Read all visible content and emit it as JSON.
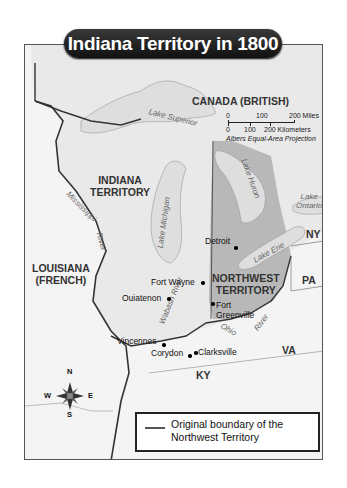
{
  "title": "Indiana Territory in 1800",
  "regions": {
    "canada": "CANADA (BRITISH)",
    "indiana": [
      "INDIANA",
      "TERRITORY"
    ],
    "louisiana": [
      "LOUISIANA",
      "(FRENCH)"
    ],
    "northwest": [
      "NORTHWEST",
      "TERRITORY"
    ],
    "ny": "NY",
    "pa": "PA",
    "va": "VA",
    "ky": "KY"
  },
  "water": {
    "superior": "Lake Superior",
    "michigan": "Lake Michigan",
    "huron": "Lake Huron",
    "erie": "Lake Erie",
    "ontario": [
      "Lake",
      "Ontario"
    ],
    "mississippi": "Mississippi",
    "mississippi_river": "River",
    "wabash": "Wabash River",
    "ohio": "Ohio",
    "ohio_river": "River"
  },
  "cities": {
    "detroit": "Detroit",
    "fort_wayne": "Fort Wayne",
    "ouiatenon": "Ouiatenon",
    "fort_greenville": [
      "Fort",
      "Greenville"
    ],
    "vincennes": "Vincennes",
    "corydon": "Corydon",
    "clarksville": "Clarksville"
  },
  "scale": {
    "miles": [
      "0",
      "100",
      "200 Miles"
    ],
    "km": [
      "0",
      "100",
      "200 Kilometers"
    ],
    "projection": "Albers Equal-Area Projection"
  },
  "compass": {
    "n": "N",
    "s": "S",
    "e": "E",
    "w": "W"
  },
  "legend": {
    "text": [
      "Original boundary of the",
      "Northwest Territory"
    ]
  },
  "colors": {
    "land": "#ececec",
    "water": "#dcdcdc",
    "northwest": "#b4b4b4",
    "border": "#333333"
  }
}
